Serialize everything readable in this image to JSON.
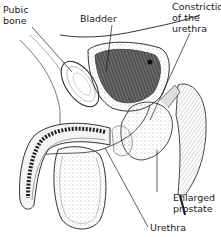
{
  "diagram": {
    "labels": {
      "pubic_bone": "Pubic\nbone",
      "bladder": "Bladder",
      "constriction": "Constriction\nof the\nurethra",
      "enlarged_prostate": "Enlarged\nprostate",
      "urethra": "Urethra"
    },
    "colors": {
      "background": "#ffffff",
      "ink": "#1a1a1a",
      "shade_dark": "#3a3a3a",
      "shade_mid": "#8a8a8a",
      "shade_light": "#d9d9d9"
    }
  }
}
